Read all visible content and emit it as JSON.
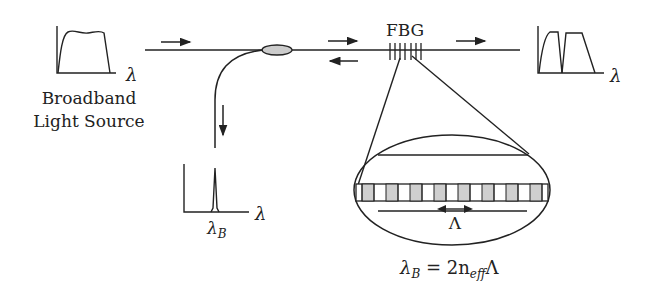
{
  "diagram": {
    "labels": {
      "fbg": "FBG",
      "source_line1": "Broadband",
      "source_line2": "Light Source",
      "lambda": "λ",
      "lambda_b": "λ",
      "lambda_b_sub": "B",
      "period": "Λ",
      "equation_lhs": "λ",
      "equation_lhs_sub": "B",
      "equation_mid": " = 2n",
      "equation_sub": "eff",
      "equation_rhs": "Λ"
    },
    "spectra": [
      {
        "id": "input",
        "description": "broadband input spectrum"
      },
      {
        "id": "reflected",
        "description": "narrow reflected peak at λB"
      },
      {
        "id": "transmitted",
        "description": "transmitted spectrum with notch at λB"
      }
    ],
    "grating_cells": 16,
    "colors": {
      "line": "#222222",
      "coupler_fill": "#cccccc",
      "grating_shade": "#cfcfcf"
    }
  }
}
